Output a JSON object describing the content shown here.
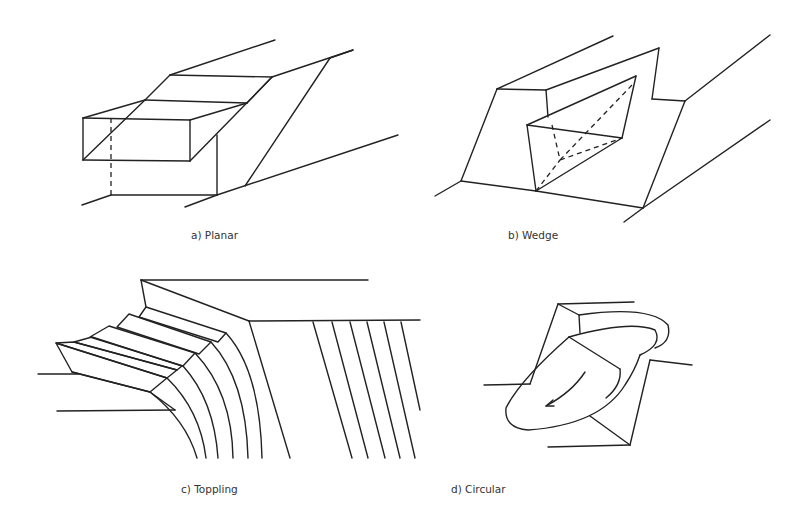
{
  "figure": {
    "panels": [
      {
        "id": "a",
        "caption": "a) Planar"
      },
      {
        "id": "b",
        "caption": "b) Wedge"
      },
      {
        "id": "c",
        "caption": "c) Toppling"
      },
      {
        "id": "d",
        "caption": "d) Circular"
      }
    ]
  }
}
